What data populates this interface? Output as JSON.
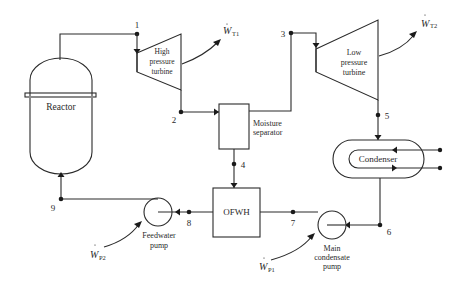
{
  "diagram": {
    "type": "PWR Rankine cycle with reheat moisture separator and open feedwater heater",
    "components": {
      "reactor": {
        "label": "Reactor"
      },
      "hp_turbine": {
        "label_lines": [
          "High",
          "pressure",
          "turbine"
        ]
      },
      "lp_turbine": {
        "label_lines": [
          "Low",
          "pressure",
          "turbine"
        ]
      },
      "moisture_separator": {
        "label_lines": [
          "Moisture",
          "separator"
        ]
      },
      "condenser": {
        "label": "Condenser"
      },
      "ofwh": {
        "label": "OFWH"
      },
      "feedwater_pump": {
        "label_lines": [
          "Feedwater",
          "pump"
        ]
      },
      "main_condensate_pump": {
        "label_lines": [
          "Main",
          "condensate",
          "pump"
        ]
      }
    },
    "work_labels": {
      "wt1": {
        "symbol": "W",
        "sub": "T1"
      },
      "wt2": {
        "symbol": "W",
        "sub": "T2"
      },
      "wp1": {
        "symbol": "W",
        "sub": "P1"
      },
      "wp2": {
        "symbol": "W",
        "sub": "P2"
      }
    },
    "state_points": [
      "1",
      "2",
      "3",
      "4",
      "5",
      "6",
      "7",
      "8",
      "9"
    ]
  }
}
